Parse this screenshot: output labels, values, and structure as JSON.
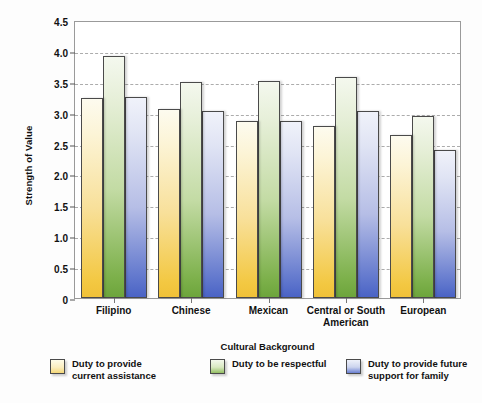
{
  "chart_data": {
    "type": "bar",
    "title": "",
    "xlabel": "Cultural Background",
    "ylabel": "Strength of Value",
    "ylim": [
      0,
      4.5
    ],
    "ytick_labels": [
      "4.5",
      "4.0",
      "3.5",
      "3.0",
      "2.5",
      "2.0",
      "1.5",
      "1.0",
      "0.5",
      "0"
    ],
    "ytick_values": [
      4.5,
      4.0,
      3.5,
      3.0,
      2.5,
      2.0,
      1.5,
      1.0,
      0.5,
      0
    ],
    "grid": true,
    "legend_position": "bottom",
    "categories": [
      "Filipino",
      "Chinese",
      "Mexican",
      "Central or South\nAmerican",
      "European"
    ],
    "series": [
      {
        "name": "Duty to provide\ncurrent assistance",
        "color": "#F0C138",
        "values": [
          3.23,
          3.06,
          2.86,
          2.78,
          2.64
        ]
      },
      {
        "name": "Duty to be respectful",
        "color": "#6DA53C",
        "values": [
          3.92,
          3.5,
          3.52,
          3.57,
          2.95
        ]
      },
      {
        "name": "Duty to provide future\nsupport for family",
        "color": "#4A63C5",
        "values": [
          3.26,
          3.03,
          2.87,
          3.03,
          2.39
        ]
      }
    ]
  }
}
